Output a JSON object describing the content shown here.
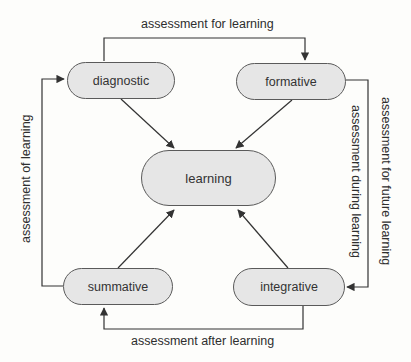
{
  "diagram": {
    "type": "cycle-flowchart",
    "colors": {
      "background": "#fdfdfb",
      "node_fill": "#e6e6e6",
      "node_border": "#5a5a5a",
      "edge": "#333333",
      "text": "#2e2e2e"
    },
    "nodes": {
      "diagnostic": {
        "label": "diagnostic"
      },
      "formative": {
        "label": "formative"
      },
      "learning": {
        "label": "learning"
      },
      "summative": {
        "label": "summative"
      },
      "integrative": {
        "label": "integrative"
      }
    },
    "edges": {
      "top": {
        "label": "assessment for learning",
        "from": "diagnostic",
        "to": "formative"
      },
      "right_outer": {
        "label": "assessment for future learning",
        "from": "formative",
        "to": "integrative"
      },
      "right_inner": {
        "label": "assessment during learning"
      },
      "bottom": {
        "label": "assessment after learning",
        "from": "integrative",
        "to": "summative"
      },
      "left": {
        "label": "assessment of learning",
        "from": "summative",
        "to": "diagnostic"
      },
      "diagnostic_to_learning": {
        "from": "diagnostic",
        "to": "learning"
      },
      "formative_to_learning": {
        "from": "formative",
        "to": "learning"
      },
      "summative_to_learning": {
        "from": "summative",
        "to": "learning"
      },
      "integrative_to_learning": {
        "from": "integrative",
        "to": "learning"
      }
    }
  }
}
